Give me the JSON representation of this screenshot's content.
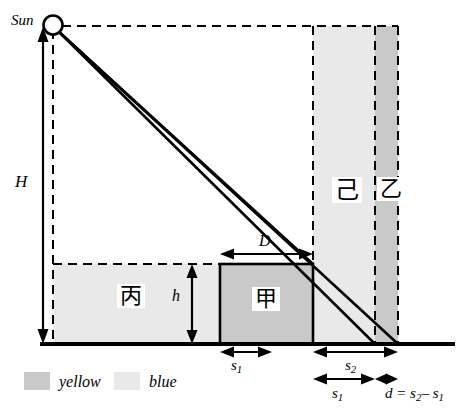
{
  "figure": {
    "colors": {
      "yellow_fill": "#c9c9c9",
      "blue_fill": "#e9e9e9",
      "stroke": "#000000",
      "background": "#ffffff"
    },
    "labels": {
      "sun": "Sun",
      "height_H": "H",
      "height_h": "h",
      "width_D": "D",
      "region_jia": "甲",
      "region_bing": "丙",
      "region_ji": "己",
      "region_yi": "乙"
    },
    "measurements": {
      "s1_left": "s",
      "s1_left_sub": "1",
      "s2": "s",
      "s2_sub": "2",
      "s1_right": "s",
      "s1_right_sub": "1",
      "d_expr_prefix": "d = s",
      "d_expr_sub1": "2",
      "d_expr_mid": "– s",
      "d_expr_sub2": "1"
    },
    "legend": {
      "items": [
        {
          "swatch": "#c9c9c9",
          "label": "yellow"
        },
        {
          "swatch": "#e9e9e9",
          "label": "blue"
        }
      ]
    }
  }
}
